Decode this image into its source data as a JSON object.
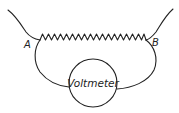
{
  "diagram": {
    "type": "circuit",
    "labels": {
      "point_a": "A",
      "point_b": "B",
      "meter": "Voltmeter"
    },
    "components": [
      {
        "name": "resistance-wire",
        "kind": "zigzag resistor",
        "from": "A",
        "to": "B"
      },
      {
        "name": "voltmeter",
        "kind": "meter",
        "connected_between": [
          "A",
          "B"
        ]
      }
    ],
    "colors": {
      "line": "#222222",
      "background": "#ffffff"
    }
  }
}
